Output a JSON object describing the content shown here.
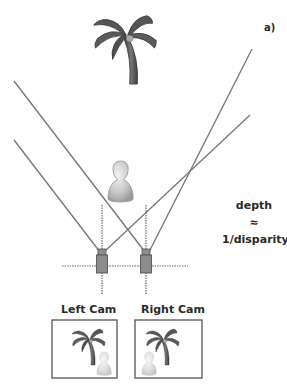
{
  "figure": {
    "label": "a)",
    "formula": {
      "line1": "depth",
      "line2": "≈",
      "line3": "1/disparity"
    },
    "cameras": [
      {
        "name": "left",
        "label": "Left Cam",
        "icon": "camera-icon"
      },
      {
        "name": "right",
        "label": "Right Cam",
        "icon": "camera-icon"
      }
    ],
    "objects": [
      {
        "name": "palm-tree",
        "icon": "palm-tree-icon",
        "depth": "far"
      },
      {
        "name": "person",
        "icon": "person-icon",
        "depth": "near"
      }
    ],
    "colors": {
      "ray": "#7a7a7a",
      "camera_body": "#8c8c8c",
      "camera_outline": "#555555",
      "tree": "#555555",
      "person": "#c8c8c8",
      "text": "#2a2a2a"
    }
  }
}
